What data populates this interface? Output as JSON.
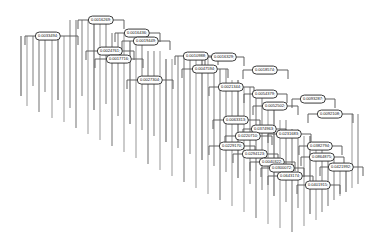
{
  "figure": {
    "type": "dendrogram",
    "title": "",
    "background_color": "#ffffff",
    "line_color": "#5a5a5a",
    "label_border_color": "#3a3a3a",
    "label_text_color": "#141414",
    "width": 380,
    "height": 247
  },
  "chart_data": {
    "type": "dendrogram",
    "title": "",
    "xlabel": "",
    "ylabel": "",
    "orientation": "top-down",
    "grid": false,
    "legend": false,
    "value_format": "0.0000000",
    "nodes": [
      {
        "id": "n1",
        "label": "0.0016269;",
        "x": 101,
        "y": 20,
        "merge_left": 78,
        "merge_right": 124,
        "height": 0.0016269
      },
      {
        "id": "n2",
        "label": "0.0033494;",
        "x": 48,
        "y": 36,
        "merge_left": 25,
        "merge_right": 78,
        "height": 0.0033494
      },
      {
        "id": "n3",
        "label": "0.0016436;",
        "x": 137,
        "y": 33,
        "merge_left": 115,
        "merge_right": 160,
        "height": 0.0016436
      },
      {
        "id": "n4",
        "label": "0.0019449;",
        "x": 146,
        "y": 41,
        "merge_left": 122,
        "merge_right": 170,
        "height": 0.0019449
      },
      {
        "id": "n5",
        "label": "0.0024761;",
        "x": 110,
        "y": 51,
        "merge_left": 86,
        "merge_right": 134,
        "height": 0.0024761
      },
      {
        "id": "n6",
        "label": "0.0017716;",
        "x": 119,
        "y": 59,
        "merge_left": 95,
        "merge_right": 143,
        "height": 0.0017716
      },
      {
        "id": "n7",
        "label": "0.0010988;",
        "x": 196,
        "y": 56,
        "merge_left": 175,
        "merge_right": 218,
        "height": 0.0010988
      },
      {
        "id": "n8",
        "label": "0.0016329;",
        "x": 224,
        "y": 57,
        "merge_left": 205,
        "merge_right": 244,
        "height": 0.0016329
      },
      {
        "id": "n9",
        "label": "0.0018574;",
        "x": 265,
        "y": 70,
        "merge_left": 243,
        "merge_right": 288,
        "height": 0.0018574
      },
      {
        "id": "n10",
        "label": "0.0047594;",
        "x": 205,
        "y": 69,
        "merge_left": 182,
        "merge_right": 228,
        "height": 0.0047594
      },
      {
        "id": "n11",
        "label": "0.0027304;",
        "x": 150,
        "y": 80,
        "merge_left": 127,
        "merge_right": 173,
        "height": 0.0027304
      },
      {
        "id": "n12",
        "label": "0.0021344;",
        "x": 231,
        "y": 87,
        "merge_left": 209,
        "merge_right": 254,
        "height": 0.0021344
      },
      {
        "id": "n13",
        "label": "0.0054379;",
        "x": 265,
        "y": 94,
        "merge_left": 244,
        "merge_right": 287,
        "height": 0.0054379
      },
      {
        "id": "n14",
        "label": "0.0093287;",
        "x": 313,
        "y": 99,
        "merge_left": 292,
        "merge_right": 335,
        "height": 0.0093287
      },
      {
        "id": "n15",
        "label": "0.0052502;",
        "x": 275,
        "y": 106,
        "merge_left": 253,
        "merge_right": 298,
        "height": 0.0052502
      },
      {
        "id": "n16",
        "label": "0.0092108;",
        "x": 330,
        "y": 114,
        "merge_left": 308,
        "merge_right": 353,
        "height": 0.0092108
      },
      {
        "id": "n17",
        "label": "0.0063313;",
        "x": 236,
        "y": 120,
        "merge_left": 213,
        "merge_right": 260,
        "height": 0.0063313
      },
      {
        "id": "n18",
        "label": "0.0374963;",
        "x": 264,
        "y": 129,
        "merge_left": 243,
        "merge_right": 286,
        "height": 0.0374963
      },
      {
        "id": "n19",
        "label": "0.0220710;",
        "x": 248,
        "y": 136,
        "merge_left": 225,
        "merge_right": 272,
        "height": 0.022071
      },
      {
        "id": "n20",
        "label": "0.0231683;",
        "x": 289,
        "y": 134,
        "merge_left": 268,
        "merge_right": 311,
        "height": 0.0231683
      },
      {
        "id": "n21",
        "label": "0.0382794;",
        "x": 320,
        "y": 146,
        "merge_left": 299,
        "merge_right": 342,
        "height": 0.0382794
      },
      {
        "id": "n22",
        "label": "0.0229170;",
        "x": 232,
        "y": 146,
        "merge_left": 209,
        "merge_right": 255,
        "height": 0.022917
      },
      {
        "id": "n23",
        "label": "0.0294123;",
        "x": 255,
        "y": 154,
        "merge_left": 233,
        "merge_right": 278,
        "height": 0.0294123
      },
      {
        "id": "n24",
        "label": "0.0864875;",
        "x": 322,
        "y": 157,
        "merge_left": 301,
        "merge_right": 344,
        "height": 0.0864875
      },
      {
        "id": "n25",
        "label": "0.0040322;",
        "x": 272,
        "y": 162,
        "merge_left": 250,
        "merge_right": 295,
        "height": 0.0040322
      },
      {
        "id": "n26",
        "label": "0.0421992;",
        "x": 341,
        "y": 167,
        "merge_left": 320,
        "merge_right": 363,
        "height": 0.0421992
      },
      {
        "id": "n27",
        "label": "0.0300072;",
        "x": 282,
        "y": 168,
        "merge_left": 261,
        "merge_right": 304,
        "height": 0.0300072
      },
      {
        "id": "n28",
        "label": "0.0643174;",
        "x": 290,
        "y": 176,
        "merge_left": 268,
        "merge_right": 313,
        "height": 0.0643174
      },
      {
        "id": "n29",
        "label": "0.0401915;",
        "x": 318,
        "y": 185,
        "merge_left": 297,
        "merge_right": 340,
        "height": 0.0401915
      }
    ],
    "leaf_count": 92,
    "leaves": [
      {
        "x": 21,
        "y0": 36,
        "y1": 96
      },
      {
        "x": 27,
        "y0": 36,
        "y1": 106
      },
      {
        "x": 33,
        "y0": 36,
        "y1": 86
      },
      {
        "x": 39,
        "y0": 36,
        "y1": 112
      },
      {
        "x": 45,
        "y0": 36,
        "y1": 92
      },
      {
        "x": 52,
        "y0": 36,
        "y1": 118
      },
      {
        "x": 58,
        "y0": 36,
        "y1": 100
      },
      {
        "x": 64,
        "y0": 36,
        "y1": 122
      },
      {
        "x": 70,
        "y0": 20,
        "y1": 108
      },
      {
        "x": 76,
        "y0": 20,
        "y1": 128
      },
      {
        "x": 82,
        "y0": 20,
        "y1": 96
      },
      {
        "x": 88,
        "y0": 20,
        "y1": 134
      },
      {
        "x": 94,
        "y0": 20,
        "y1": 110
      },
      {
        "x": 100,
        "y0": 20,
        "y1": 140
      },
      {
        "x": 106,
        "y0": 20,
        "y1": 104
      },
      {
        "x": 112,
        "y0": 33,
        "y1": 146
      },
      {
        "x": 118,
        "y0": 33,
        "y1": 116
      },
      {
        "x": 124,
        "y0": 33,
        "y1": 152
      },
      {
        "x": 130,
        "y0": 41,
        "y1": 124
      },
      {
        "x": 136,
        "y0": 41,
        "y1": 158
      },
      {
        "x": 142,
        "y0": 41,
        "y1": 130
      },
      {
        "x": 148,
        "y0": 51,
        "y1": 164
      },
      {
        "x": 154,
        "y0": 51,
        "y1": 136
      },
      {
        "x": 160,
        "y0": 51,
        "y1": 170
      },
      {
        "x": 166,
        "y0": 59,
        "y1": 142
      },
      {
        "x": 172,
        "y0": 59,
        "y1": 176
      },
      {
        "x": 178,
        "y0": 56,
        "y1": 148
      },
      {
        "x": 184,
        "y0": 56,
        "y1": 182
      },
      {
        "x": 190,
        "y0": 56,
        "y1": 154
      },
      {
        "x": 196,
        "y0": 56,
        "y1": 188
      },
      {
        "x": 202,
        "y0": 57,
        "y1": 160
      },
      {
        "x": 208,
        "y0": 57,
        "y1": 194
      },
      {
        "x": 214,
        "y0": 69,
        "y1": 166
      },
      {
        "x": 220,
        "y0": 69,
        "y1": 200
      },
      {
        "x": 226,
        "y0": 69,
        "y1": 172
      },
      {
        "x": 232,
        "y0": 80,
        "y1": 206
      },
      {
        "x": 238,
        "y0": 80,
        "y1": 178
      },
      {
        "x": 244,
        "y0": 87,
        "y1": 212
      },
      {
        "x": 250,
        "y0": 87,
        "y1": 184
      },
      {
        "x": 256,
        "y0": 94,
        "y1": 218
      },
      {
        "x": 262,
        "y0": 94,
        "y1": 190
      },
      {
        "x": 268,
        "y0": 106,
        "y1": 224
      },
      {
        "x": 274,
        "y0": 106,
        "y1": 196
      },
      {
        "x": 280,
        "y0": 120,
        "y1": 228
      },
      {
        "x": 286,
        "y0": 120,
        "y1": 202
      },
      {
        "x": 292,
        "y0": 129,
        "y1": 232
      },
      {
        "x": 298,
        "y0": 129,
        "y1": 208
      },
      {
        "x": 304,
        "y0": 136,
        "y1": 226
      },
      {
        "x": 310,
        "y0": 136,
        "y1": 214
      },
      {
        "x": 316,
        "y0": 146,
        "y1": 220
      },
      {
        "x": 322,
        "y0": 146,
        "y1": 212
      },
      {
        "x": 328,
        "y0": 157,
        "y1": 206
      },
      {
        "x": 334,
        "y0": 157,
        "y1": 200
      },
      {
        "x": 340,
        "y0": 167,
        "y1": 196
      },
      {
        "x": 346,
        "y0": 167,
        "y1": 192
      },
      {
        "x": 352,
        "y0": 114,
        "y1": 188
      },
      {
        "x": 358,
        "y0": 114,
        "y1": 184
      }
    ]
  }
}
